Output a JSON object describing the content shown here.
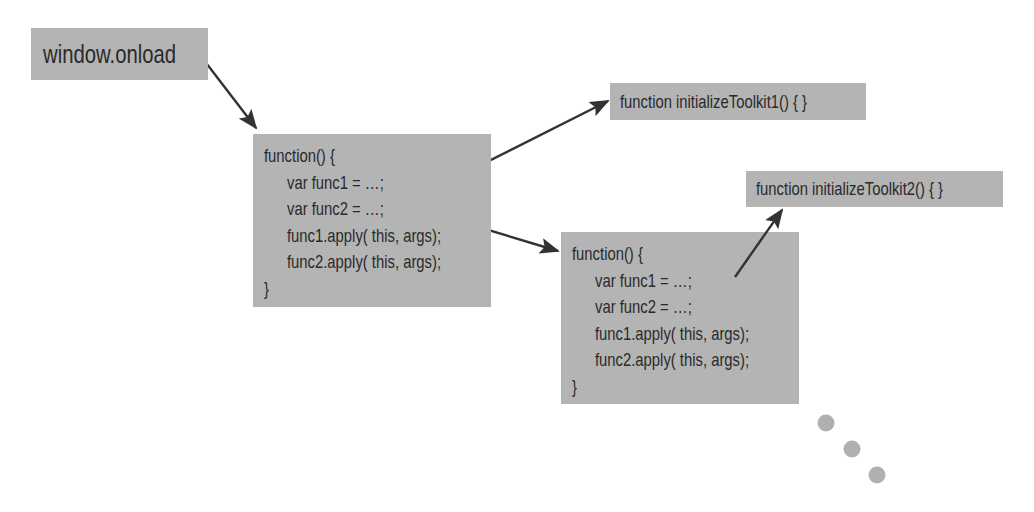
{
  "diagram": {
    "nodes": {
      "onload": {
        "label": "window.onload"
      },
      "toolkit1": {
        "label": "function initializeToolkit1() { }"
      },
      "toolkit2": {
        "label": "function initializeToolkit2() { }"
      },
      "wrapper1": {
        "lines": [
          "function() {",
          "var func1 = …;",
          "var func2 = …;",
          "func1.apply( this, args);",
          "func2.apply( this, args);",
          "}"
        ]
      },
      "wrapper2": {
        "lines": [
          "function() {",
          "var func1 = …;",
          "var func2 = …;",
          "func1.apply( this, args);",
          "func2.apply( this, args);",
          "}"
        ]
      }
    },
    "edges": [
      {
        "from": "onload",
        "to": "wrapper1"
      },
      {
        "from": "wrapper1.func1",
        "to": "toolkit1"
      },
      {
        "from": "wrapper1.func2",
        "to": "wrapper2"
      },
      {
        "from": "wrapper2.func1",
        "to": "toolkit2"
      }
    ],
    "continuation": {
      "icon": "ellipsis-dots-icon",
      "count": 3
    },
    "colors": {
      "box_fill": "#b4b4b4",
      "text": "#2a2a2a",
      "arrow": "#333333",
      "dots": "#b0b0b0"
    }
  }
}
